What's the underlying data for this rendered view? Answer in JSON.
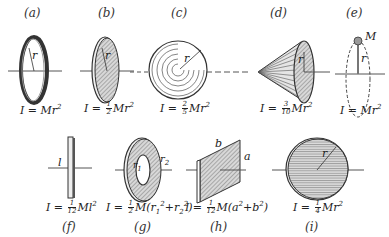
{
  "figures": [
    {
      "id": "a",
      "label": "(a)",
      "shape": "thin ring / hoop",
      "formula_lhs": "I = ",
      "formula_rhs": "Mr",
      "exp": "2",
      "symbols": [
        "r"
      ]
    },
    {
      "id": "b",
      "label": "(b)",
      "shape": "solid disk",
      "formula_lhs": "I = ",
      "frac_num": "1",
      "frac_den": "2",
      "formula_rhs": "Mr",
      "exp": "2",
      "symbols": [
        "r"
      ]
    },
    {
      "id": "c",
      "label": "(c)",
      "shape": "solid sphere",
      "formula_lhs": "I = ",
      "frac_num": "2",
      "frac_den": "5",
      "formula_rhs": "Mr",
      "exp": "2",
      "symbols": [
        "r"
      ]
    },
    {
      "id": "d",
      "label": "(d)",
      "shape": "solid cone",
      "formula_lhs": "I = ",
      "frac_num": "3",
      "frac_den": "10",
      "formula_rhs": "Mr",
      "exp": "2",
      "symbols": [
        "r"
      ]
    },
    {
      "id": "e",
      "label": "(e)",
      "shape": "point mass",
      "formula_lhs": "I = ",
      "formula_rhs": "Mr",
      "exp": "2",
      "symbols": [
        "M",
        "r"
      ]
    },
    {
      "id": "f",
      "label": "(f)",
      "shape": "thin rod",
      "formula_lhs": "I = ",
      "frac_num": "1",
      "frac_den": "12",
      "formula_rhs": "Ml",
      "exp": "2",
      "symbols": [
        "l"
      ]
    },
    {
      "id": "g",
      "label": "(g)",
      "shape": "annular disk",
      "formula_lhs": "I = ",
      "frac_num": "1",
      "frac_den": "2",
      "formula_rhs": "M(r",
      "sub1": "1",
      "mid": "+r",
      "sub2": "2",
      "tail": ")",
      "symbols": [
        "r1",
        "r2"
      ]
    },
    {
      "id": "h",
      "label": "(h)",
      "shape": "rectangular plate",
      "formula_lhs": "I = ",
      "frac_num": "1",
      "frac_den": "12",
      "formula_rhs": "M(a",
      "mid": "+b",
      "tail": ")",
      "symbols": [
        "a",
        "b"
      ]
    },
    {
      "id": "i",
      "label": "(i)",
      "shape": "disk about diameter",
      "formula_lhs": "I = ",
      "frac_num": "1",
      "frac_den": "4",
      "formula_rhs": "Mr",
      "exp": "2",
      "symbols": [
        "r"
      ]
    }
  ],
  "colors": {
    "ink": "#222222",
    "shade": "#888888",
    "background": "#ffffff"
  }
}
